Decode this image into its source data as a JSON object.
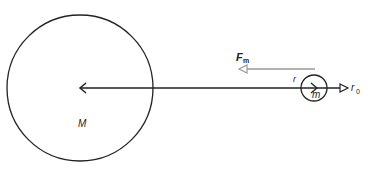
{
  "diagram": {
    "large_body": {
      "label": "M",
      "cx": 80,
      "cy": 88,
      "r": 73
    },
    "small_body": {
      "label": "m",
      "cx": 314,
      "cy": 88,
      "r": 13
    },
    "distance_label": "r",
    "unit_vector_label": "r",
    "unit_vector_subscript": "0",
    "force_label": "F",
    "force_subscript": "m",
    "colors": {
      "stroke": "#222222",
      "force_arrow": "#999999"
    }
  }
}
